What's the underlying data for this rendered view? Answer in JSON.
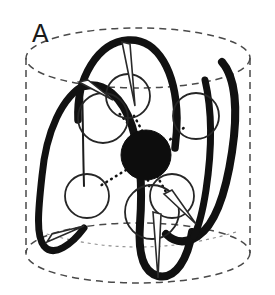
{
  "figure": {
    "panel_label": "A",
    "caption_text": "",
    "background_color": "#ffffff",
    "ink_color": "#121212",
    "outline_color": "#3a3a3a",
    "metal_color": "#0d0d0d",
    "ligand_fill": "#ffffff",
    "ligand_stroke": "#2b2b2b"
  },
  "chart_data": {
    "type": "diagram",
    "title": "A",
    "container": {
      "name": "cylinder",
      "style": "dashed",
      "center_x": 138,
      "top_ellipse": {
        "cx": 138,
        "cy": 58,
        "rx": 112,
        "ry": 30
      },
      "bottom_ellipse": {
        "cx": 138,
        "cy": 253,
        "rx": 112,
        "ry": 30
      },
      "side_left_x": 26,
      "side_right_x": 250
    },
    "metal_center": {
      "label": "metal ion",
      "cx": 146,
      "cy": 155,
      "r": 25,
      "fill": "#0d0d0d"
    },
    "ligands": [
      {
        "id": "L1",
        "cx": 103,
        "cy": 118,
        "r": 25,
        "bonded": true
      },
      {
        "id": "L2",
        "cx": 128,
        "cy": 96,
        "r": 22,
        "bonded": true
      },
      {
        "id": "L3",
        "cx": 196,
        "cy": 116,
        "r": 23,
        "bonded": true
      },
      {
        "id": "L4",
        "cx": 87,
        "cy": 196,
        "r": 22,
        "bonded": true
      },
      {
        "id": "L5",
        "cx": 164,
        "cy": 200,
        "r": 22,
        "bonded": true
      },
      {
        "id": "L6",
        "cx": 152,
        "cy": 212,
        "r": 26,
        "bonded": true
      }
    ],
    "coordination_bonds": [
      {
        "from": "metal_center",
        "to": "L1"
      },
      {
        "from": "metal_center",
        "to": "L2"
      },
      {
        "from": "metal_center",
        "to": "L3"
      },
      {
        "from": "metal_center",
        "to": "L4"
      },
      {
        "from": "metal_center",
        "to": "L5"
      },
      {
        "from": "metal_center",
        "to": "L6"
      }
    ],
    "helices": [
      {
        "id": "H1",
        "description": "left outer descending loop"
      },
      {
        "id": "H2",
        "description": "center top arch"
      },
      {
        "id": "H3",
        "description": "center descending hairpin"
      },
      {
        "id": "H4",
        "description": "right outer hairpin loop"
      }
    ],
    "arrow_wedges": [
      {
        "id": "W1",
        "location": "top-center",
        "direction": "down"
      },
      {
        "id": "W2",
        "location": "upper-left",
        "direction": "right-down"
      },
      {
        "id": "W3",
        "location": "bottom-center",
        "direction": "down"
      },
      {
        "id": "W4",
        "location": "bottom-left",
        "direction": "right"
      },
      {
        "id": "W5",
        "location": "lower-right",
        "direction": "down-right"
      }
    ],
    "legend": [],
    "axis": null,
    "grid": false
  }
}
